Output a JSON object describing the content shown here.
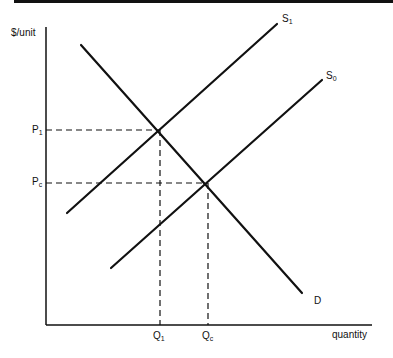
{
  "diagram": {
    "type": "supply-demand",
    "axes": {
      "y_label": "$/unit",
      "x_label": "quantity"
    },
    "curves": [
      {
        "name": "S",
        "sub": "1",
        "id": "S1",
        "from": [
          67,
          213
        ],
        "to": [
          277,
          24
        ]
      },
      {
        "name": "S",
        "sub": "0",
        "id": "S0",
        "from": [
          111,
          268
        ],
        "to": [
          322,
          80
        ]
      },
      {
        "name": "D",
        "sub": "",
        "id": "D",
        "from": [
          81,
          45
        ],
        "to": [
          302,
          293
        ]
      }
    ],
    "price_labels": [
      {
        "name": "P",
        "sub": "1"
      },
      {
        "name": "P",
        "sub": "c"
      }
    ],
    "quantity_labels": [
      {
        "name": "Q",
        "sub": "1"
      },
      {
        "name": "Q",
        "sub": "c"
      }
    ],
    "equilibria": [
      {
        "id": "E1",
        "point": [
          160,
          130
        ],
        "price": "P1",
        "quantity": "Q1"
      },
      {
        "id": "Ec",
        "point": [
          208,
          183
        ],
        "price": "Pc",
        "quantity": "Qc"
      }
    ]
  }
}
